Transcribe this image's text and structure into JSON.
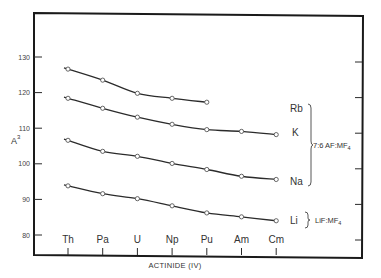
{
  "chart_data": {
    "type": "line",
    "title": "",
    "xlabel": "ACTINIDE (IV)",
    "ylabel": "Å³",
    "ylim": [
      75,
      138
    ],
    "yticks": [
      80,
      90,
      100,
      110,
      120,
      130
    ],
    "ytick_labels": [
      "80",
      "90",
      "100",
      "110",
      "120",
      "130"
    ],
    "grid": false,
    "categories": [
      "Th",
      "Pa",
      "U",
      "Np",
      "Pu",
      "Am",
      "Cm"
    ],
    "series": [
      {
        "name": "Rb",
        "group": "7:6 AF:MF4",
        "values": [
          126.6,
          123.5,
          119.8,
          118.4,
          117.3,
          null,
          null
        ]
      },
      {
        "name": "K",
        "group": "7:6 AF:MF4",
        "values": [
          118.4,
          115.6,
          113.1,
          111.1,
          109.6,
          109.1,
          108.2
        ]
      },
      {
        "name": "Na",
        "group": "7:6 AF:MF4",
        "values": [
          106.6,
          103.5,
          102.1,
          100.1,
          98.4,
          96.5,
          95.6
        ]
      },
      {
        "name": "Li",
        "group": "LiF:MF4",
        "values": [
          93.8,
          91.6,
          90.2,
          88.2,
          86.2,
          85.1,
          84.0
        ]
      }
    ],
    "annotations": {
      "group_1": {
        "label": "7:6 AF:MF",
        "subscript": "4",
        "members": [
          "Rb",
          "K",
          "Na"
        ]
      },
      "group_2": {
        "label": "LiF:MF",
        "subscript": "4",
        "members": [
          "Li"
        ]
      }
    },
    "legend_position": "right, inline labels with braces"
  },
  "labels": {
    "xlabel": "ACTINIDE (IV)",
    "ylabel_main": "A",
    "ylabel_sup": "3",
    "series_rb": "Rb",
    "series_k": "K",
    "series_na": "Na",
    "series_li": "Li",
    "group1_main": "7:6 AF:MF",
    "group1_sub": "4",
    "group2_main": "LiF:MF",
    "group2_sub": "4"
  }
}
